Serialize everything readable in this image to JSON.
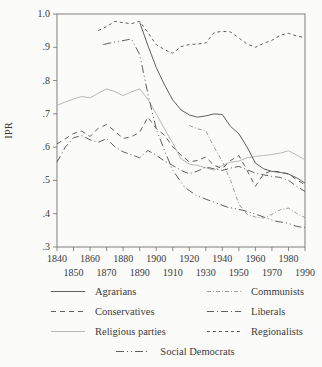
{
  "figure": {
    "y_axis_label": "IPR",
    "y_tick_labels": [
      "1.0",
      ".9",
      ".8",
      ".7",
      ".6",
      ".5",
      ".4",
      ".3"
    ],
    "x_tick_labels_row1": [
      "1840",
      "1860",
      "1880",
      "1900",
      "1920",
      "1940",
      "1960",
      "1980"
    ],
    "x_tick_labels_row2": [
      "1850",
      "1870",
      "1890",
      "1910",
      "1930",
      "1950",
      "1970",
      "1990"
    ]
  },
  "chart_data": {
    "type": "line",
    "title": "",
    "xlabel": "",
    "ylabel": "IPR",
    "xlim": [
      1840,
      1990
    ],
    "ylim": [
      0.3,
      1.0
    ],
    "x_ticks": [
      1840,
      1850,
      1860,
      1870,
      1880,
      1890,
      1900,
      1910,
      1920,
      1930,
      1940,
      1950,
      1960,
      1970,
      1980,
      1990
    ],
    "y_ticks": [
      1.0,
      0.9,
      0.8,
      0.7,
      0.6,
      0.5,
      0.4,
      0.3
    ],
    "grid": false,
    "legend_position": "below",
    "series": [
      {
        "key": "religious",
        "name": "Religious parties",
        "color": "#b8b8b8",
        "dash": [],
        "points": [
          [
            1840,
            0.725
          ],
          [
            1845,
            0.736
          ],
          [
            1850,
            0.745
          ],
          [
            1855,
            0.752
          ],
          [
            1860,
            0.748
          ],
          [
            1865,
            0.762
          ],
          [
            1870,
            0.775
          ],
          [
            1875,
            0.767
          ],
          [
            1880,
            0.755
          ],
          [
            1885,
            0.766
          ],
          [
            1890,
            0.775
          ],
          [
            1895,
            0.744
          ],
          [
            1900,
            0.7
          ],
          [
            1905,
            0.655
          ],
          [
            1910,
            0.612
          ],
          [
            1915,
            0.565
          ],
          [
            1920,
            0.549
          ],
          [
            1925,
            0.545
          ],
          [
            1930,
            0.538
          ],
          [
            1935,
            0.531
          ],
          [
            1940,
            0.545
          ],
          [
            1945,
            0.555
          ],
          [
            1950,
            0.558
          ],
          [
            1955,
            0.568
          ],
          [
            1960,
            0.572
          ],
          [
            1965,
            0.575
          ],
          [
            1970,
            0.578
          ],
          [
            1975,
            0.582
          ],
          [
            1980,
            0.589
          ],
          [
            1985,
            0.576
          ],
          [
            1990,
            0.562
          ]
        ]
      },
      {
        "key": "communists",
        "name": "Communists",
        "color": "#9c9c9c",
        "dash": [
          4,
          2,
          1,
          2
        ],
        "points": [
          [
            1920,
            0.665
          ],
          [
            1925,
            0.655
          ],
          [
            1930,
            0.649
          ],
          [
            1935,
            0.6
          ],
          [
            1940,
            0.557
          ],
          [
            1945,
            0.5
          ],
          [
            1950,
            0.428
          ],
          [
            1955,
            0.398
          ],
          [
            1960,
            0.39
          ],
          [
            1965,
            0.387
          ],
          [
            1970,
            0.398
          ],
          [
            1975,
            0.412
          ],
          [
            1980,
            0.417
          ],
          [
            1985,
            0.401
          ],
          [
            1990,
            0.388
          ]
        ]
      },
      {
        "key": "regionalists",
        "name": "Regionalists",
        "color": "#5f5f5f",
        "dash": [
          3,
          3
        ],
        "points": [
          [
            1865,
            0.95
          ],
          [
            1870,
            0.962
          ],
          [
            1875,
            0.978
          ],
          [
            1880,
            0.974
          ],
          [
            1885,
            0.971
          ],
          [
            1890,
            0.978
          ],
          [
            1895,
            0.944
          ],
          [
            1900,
            0.908
          ],
          [
            1905,
            0.893
          ],
          [
            1910,
            0.882
          ],
          [
            1915,
            0.902
          ],
          [
            1920,
            0.908
          ],
          [
            1925,
            0.91
          ],
          [
            1930,
            0.913
          ],
          [
            1935,
            0.944
          ],
          [
            1940,
            0.948
          ],
          [
            1945,
            0.946
          ],
          [
            1950,
            0.928
          ],
          [
            1955,
            0.91
          ],
          [
            1960,
            0.9
          ],
          [
            1965,
            0.912
          ],
          [
            1970,
            0.921
          ],
          [
            1975,
            0.936
          ],
          [
            1980,
            0.942
          ],
          [
            1985,
            0.934
          ],
          [
            1990,
            0.929
          ]
        ]
      },
      {
        "key": "social_democrats",
        "name": "Social Democrats",
        "color": "#5f5f5f",
        "dash": [
          8,
          3,
          1,
          3,
          1,
          3
        ],
        "points": [
          [
            1868,
            0.908
          ],
          [
            1872,
            0.913
          ],
          [
            1876,
            0.917
          ],
          [
            1880,
            0.92
          ],
          [
            1885,
            0.925
          ],
          [
            1890,
            0.878
          ],
          [
            1895,
            0.76
          ],
          [
            1900,
            0.655
          ],
          [
            1905,
            0.59
          ],
          [
            1910,
            0.531
          ],
          [
            1917,
            0.481
          ],
          [
            1924,
            0.455
          ],
          [
            1932,
            0.44
          ],
          [
            1943,
            0.42
          ],
          [
            1952,
            0.411
          ],
          [
            1958,
            0.402
          ],
          [
            1965,
            0.39
          ],
          [
            1972,
            0.378
          ],
          [
            1980,
            0.371
          ],
          [
            1985,
            0.362
          ],
          [
            1990,
            0.358
          ]
        ]
      },
      {
        "key": "liberals",
        "name": "Liberals",
        "color": "#5f5f5f",
        "dash": [
          7,
          3,
          1,
          3
        ],
        "points": [
          [
            1840,
            0.555
          ],
          [
            1845,
            0.6
          ],
          [
            1850,
            0.628
          ],
          [
            1855,
            0.635
          ],
          [
            1860,
            0.622
          ],
          [
            1865,
            0.615
          ],
          [
            1870,
            0.625
          ],
          [
            1875,
            0.601
          ],
          [
            1880,
            0.586
          ],
          [
            1885,
            0.577
          ],
          [
            1890,
            0.568
          ],
          [
            1895,
            0.59
          ],
          [
            1900,
            0.576
          ],
          [
            1905,
            0.558
          ],
          [
            1910,
            0.545
          ],
          [
            1915,
            0.53
          ],
          [
            1920,
            0.52
          ],
          [
            1925,
            0.528
          ],
          [
            1930,
            0.54
          ],
          [
            1935,
            0.535
          ],
          [
            1940,
            0.53
          ],
          [
            1945,
            0.537
          ],
          [
            1950,
            0.542
          ],
          [
            1955,
            0.532
          ],
          [
            1960,
            0.522
          ],
          [
            1965,
            0.517
          ],
          [
            1970,
            0.512
          ],
          [
            1975,
            0.509
          ],
          [
            1980,
            0.5
          ],
          [
            1985,
            0.482
          ],
          [
            1990,
            0.467
          ]
        ]
      },
      {
        "key": "conservatives",
        "name": "Conservatives",
        "color": "#5f5f5f",
        "dash": [
          5,
          4
        ],
        "points": [
          [
            1840,
            0.61
          ],
          [
            1845,
            0.625
          ],
          [
            1850,
            0.641
          ],
          [
            1855,
            0.648
          ],
          [
            1860,
            0.632
          ],
          [
            1865,
            0.657
          ],
          [
            1870,
            0.668
          ],
          [
            1875,
            0.648
          ],
          [
            1880,
            0.626
          ],
          [
            1885,
            0.631
          ],
          [
            1890,
            0.645
          ],
          [
            1895,
            0.69
          ],
          [
            1900,
            0.656
          ],
          [
            1905,
            0.636
          ],
          [
            1910,
            0.601
          ],
          [
            1915,
            0.576
          ],
          [
            1920,
            0.556
          ],
          [
            1925,
            0.56
          ],
          [
            1930,
            0.57
          ],
          [
            1935,
            0.545
          ],
          [
            1940,
            0.536
          ],
          [
            1945,
            0.56
          ],
          [
            1950,
            0.575
          ],
          [
            1955,
            0.53
          ],
          [
            1960,
            0.482
          ],
          [
            1965,
            0.52
          ],
          [
            1970,
            0.529
          ],
          [
            1975,
            0.525
          ],
          [
            1980,
            0.52
          ],
          [
            1985,
            0.502
          ],
          [
            1990,
            0.487
          ]
        ]
      },
      {
        "key": "agrarians",
        "name": "Agrarians",
        "color": "#5f5f5f",
        "dash": [],
        "points": [
          [
            1890,
            0.975
          ],
          [
            1895,
            0.905
          ],
          [
            1900,
            0.84
          ],
          [
            1905,
            0.787
          ],
          [
            1910,
            0.742
          ],
          [
            1915,
            0.712
          ],
          [
            1920,
            0.697
          ],
          [
            1925,
            0.69
          ],
          [
            1930,
            0.694
          ],
          [
            1935,
            0.7
          ],
          [
            1940,
            0.698
          ],
          [
            1945,
            0.662
          ],
          [
            1950,
            0.64
          ],
          [
            1955,
            0.6
          ],
          [
            1960,
            0.552
          ],
          [
            1965,
            0.535
          ],
          [
            1970,
            0.527
          ],
          [
            1975,
            0.524
          ],
          [
            1980,
            0.519
          ],
          [
            1985,
            0.508
          ],
          [
            1990,
            0.492
          ]
        ]
      }
    ]
  },
  "legend": {
    "items": [
      {
        "label": "Agrarians",
        "series": "agrarians"
      },
      {
        "label": "Communists",
        "series": "communists"
      },
      {
        "label": "Conservatives",
        "series": "conservatives"
      },
      {
        "label": "Liberals",
        "series": "liberals"
      },
      {
        "label": "Religious parties",
        "series": "religious"
      },
      {
        "label": "Regionalists",
        "series": "regionalists"
      },
      {
        "label": "Social Democrats",
        "series": "social_democrats"
      }
    ]
  }
}
